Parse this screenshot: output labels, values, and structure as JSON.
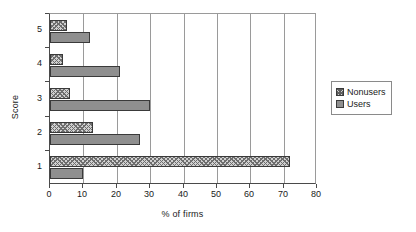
{
  "chart_data": {
    "type": "bar",
    "orientation": "horizontal",
    "title": "",
    "xlabel": "% of firms",
    "ylabel": "Score",
    "categories": [
      "1",
      "2",
      "3",
      "4",
      "5"
    ],
    "series": [
      {
        "name": "Nonusers",
        "values": [
          72,
          13,
          6,
          4,
          5
        ]
      },
      {
        "name": "Users",
        "values": [
          10,
          27,
          30,
          21,
          12
        ]
      }
    ],
    "xlim": [
      0,
      80
    ],
    "xticks": [
      0,
      10,
      20,
      30,
      40,
      50,
      60,
      70,
      80
    ],
    "xtick_labels": [
      "0",
      "10",
      "20",
      "30",
      "40",
      "50",
      "60",
      "70",
      "80"
    ],
    "yticks": [
      "1",
      "2",
      "3",
      "4",
      "5"
    ],
    "grid": "vertical",
    "legend_position": "right",
    "legend_entries": [
      "Nonusers",
      "Users"
    ],
    "colors": {
      "nonusers_fill": "#d0d0d0",
      "nonusers_hatch": "#6e6e6e",
      "users_fill": "#8f8f8f",
      "bar_outline": "#3a3a3a",
      "gridline": "#9a9a9a",
      "axis": "#4a4a4a",
      "background": "#ffffff",
      "text": "#1a1a1a"
    }
  }
}
